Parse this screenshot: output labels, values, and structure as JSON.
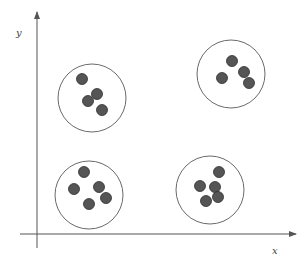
{
  "diagram": {
    "type": "cluster-scatter",
    "axes": {
      "origin": [
        37,
        234
      ],
      "x": {
        "label": "x",
        "from": 20,
        "to": 296,
        "label_pos": [
          272,
          254
        ]
      },
      "y": {
        "label": "y",
        "from": 248,
        "to": 12,
        "label_pos": [
          16,
          36
        ]
      },
      "color": "#555555"
    },
    "clusters": [
      {
        "name": "top-left",
        "center": [
          92,
          98
        ],
        "r": 34,
        "points": [
          [
            82,
            79
          ],
          [
            97,
            94
          ],
          [
            88,
            101
          ],
          [
            102,
            110
          ]
        ]
      },
      {
        "name": "top-right",
        "center": [
          231,
          74
        ],
        "r": 34,
        "points": [
          [
            232,
            61
          ],
          [
            244,
            72
          ],
          [
            222,
            78
          ],
          [
            249,
            83
          ]
        ]
      },
      {
        "name": "bottom-left",
        "center": [
          89,
          195
        ],
        "r": 34,
        "points": [
          [
            84,
            172
          ],
          [
            74,
            189
          ],
          [
            99,
            187
          ],
          [
            106,
            198
          ],
          [
            89,
            204
          ]
        ]
      },
      {
        "name": "bottom-right",
        "center": [
          210,
          190
        ],
        "r": 34,
        "points": [
          [
            219,
            172
          ],
          [
            200,
            186
          ],
          [
            215,
            187
          ],
          [
            218,
            197
          ],
          [
            206,
            201
          ]
        ]
      }
    ],
    "style": {
      "circle_stroke": "#6a6a6a",
      "point_fill": "#555555",
      "point_stroke": "#2e2e2e",
      "point_r": 5.5
    }
  }
}
